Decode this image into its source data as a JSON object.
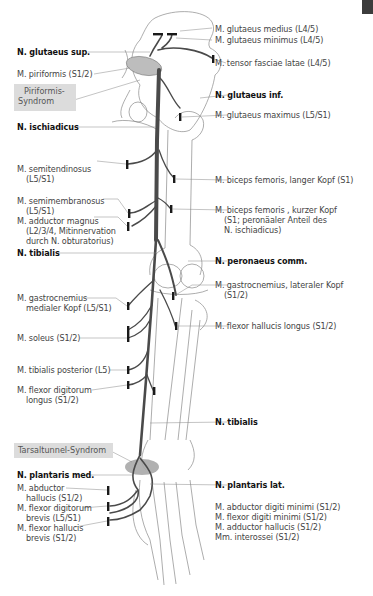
{
  "figure": {
    "corner_tab_color": "#3c3c3c",
    "nerve_color": "#4a4a4a",
    "bone_outline_color": "#888888",
    "syndrome_box_color": "#dcdcdc"
  },
  "left_labels": {
    "n_glutaeus_sup": "N. glutaeus sup.",
    "m_piriformis": "M. piriformis (S1/2)",
    "piriformis_syndrom_1": "Piriformis-",
    "piriformis_syndrom_2": "Syndrom",
    "n_ischiadicus": "N. ischiadicus",
    "m_semitendinosus_1": "M. semitendinosus",
    "m_semitendinosus_2": "(L5/S1)",
    "m_semimembranosus_1": "M. semimembranosus",
    "m_semimembranosus_2": "(L5/S1)",
    "m_adductor_magnus_1": "M. adductor magnus",
    "m_adductor_magnus_2": "(L2/3/4, Mitinnervation",
    "m_adductor_magnus_3": "durch N. obturatorius)",
    "n_tibialis_top": "N. tibialis",
    "m_gastrocnemius_med_1": "M. gastrocnemius",
    "m_gastrocnemius_med_2": "medialer Kopf (L5/S1)",
    "m_soleus": "M. soleus (S1/2)",
    "m_tibialis_posterior": "M. tibialis posterior (L5)",
    "m_flexor_digitorum_longus_1": "M. flexor digitorum",
    "m_flexor_digitorum_longus_2": "longus (S1/2)",
    "tarsaltunnel_syndrom": "Tarsaltunnel-Syndrom",
    "n_plantaris_med": "N. plantaris med.",
    "m_abductor_hallucis_1": "M. abductor",
    "m_abductor_hallucis_2": "hallucis (S1/2)",
    "m_flexor_digitorum_brevis_1": "M. flexor digitorum",
    "m_flexor_digitorum_brevis_2": "brevis (L5/S1)",
    "m_flexor_hallucis_brevis_1": "M. flexor hallucis",
    "m_flexor_hallucis_brevis_2": "brevis (S1/2)"
  },
  "right_labels": {
    "m_glutaeus_medius": "M. glutaeus medius (L4/5)",
    "m_glutaeus_minimus": "M. glutaeus minimus (L4/5)",
    "m_tensor_fasciae_latae": "M. tensor fasciae latae (L4/5)",
    "n_glutaeus_inf": "N. glutaeus inf.",
    "m_glutaeus_maximus": "M. glutaeus maximus (L5/S1)",
    "m_biceps_long_1": "M. biceps femoris, langer Kopf (S1)",
    "m_biceps_short_1": "M. biceps femoris , kurzer Kopf",
    "m_biceps_short_2": "(S1; peronäaler Anteil des",
    "m_biceps_short_3": "N. ischiadicus)",
    "n_peronaeus_comm": "N. peronaeus comm.",
    "m_gastrocnemius_lat_1": "M. gastrocnemius, lateraler Kopf",
    "m_gastrocnemius_lat_2": "(S1/2)",
    "m_flexor_hallucis_longus": "M. flexor hallucis longus (S1/2)",
    "n_tibialis_bottom": "N. tibialis",
    "n_plantaris_lat": "N. plantaris lat.",
    "lat_muscles": [
      "M. abductor digiti minimi (S1/2)",
      "M. flexor digiti minimi (S1/2)",
      "M. adductor hallucis (S1/2)",
      "Mm. interossei (S1/2)"
    ]
  }
}
